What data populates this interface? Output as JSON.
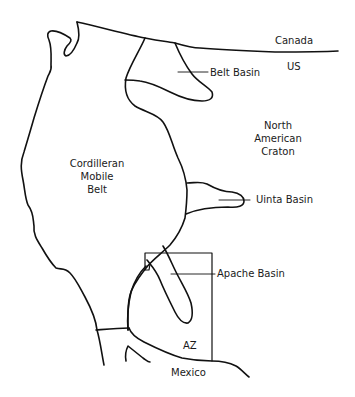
{
  "diagram": {
    "type": "geologic-map-sketch",
    "labels": {
      "canada": "Canada",
      "us": "US",
      "belt_basin": "Belt Basin",
      "north_american_craton": [
        "North",
        "American",
        "Craton"
      ],
      "cordilleran_mobile_belt": [
        "Cordilleran",
        "Mobile",
        "Belt"
      ],
      "uinta_basin": "Uinta Basin",
      "apache_basin": "Apache Basin",
      "az": "AZ",
      "mexico": "Mexico"
    },
    "colors": {
      "line": "#111111",
      "text": "#1a1a1a",
      "background": "#ffffff"
    }
  }
}
